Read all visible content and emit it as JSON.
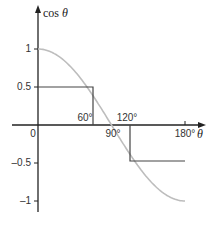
{
  "chart_data": {
    "type": "line",
    "title": "",
    "xlabel": "θ",
    "ylabel": "cos θ",
    "xlim": [
      0,
      180
    ],
    "ylim": [
      -1,
      1
    ],
    "x_ticks": [
      {
        "value": 0,
        "label": "0"
      },
      {
        "value": 60,
        "label": "60°"
      },
      {
        "value": 90,
        "label": "90°"
      },
      {
        "value": 120,
        "label": "120°"
      },
      {
        "value": 180,
        "label": "180°"
      }
    ],
    "y_ticks": [
      {
        "value": 1,
        "label": "1"
      },
      {
        "value": 0.5,
        "label": "0.5"
      },
      {
        "value": -0.5,
        "label": "–0.5"
      },
      {
        "value": -1,
        "label": "–1"
      }
    ],
    "series": [
      {
        "name": "cos θ",
        "color": "#bdbdbd",
        "x": [
          0,
          15,
          30,
          45,
          60,
          75,
          90,
          105,
          120,
          135,
          150,
          165,
          180
        ],
        "values": [
          1,
          0.966,
          0.866,
          0.707,
          0.5,
          0.259,
          0,
          -0.259,
          -0.5,
          -0.707,
          -0.866,
          -0.966,
          -1
        ]
      }
    ],
    "annotations": [
      {
        "type": "guide",
        "x": 60,
        "y": 0.5,
        "desc": "horizontal from y-axis at 0.5 to curve, vertical down to x-axis at 60°"
      },
      {
        "type": "guide",
        "x": 120,
        "y": -0.5,
        "desc": "vertical from x-axis at 120° down to curve, horizontal to 180° at -0.5"
      }
    ],
    "grid": false,
    "legend": "none"
  },
  "axis": {
    "y_title_prefix": "cos ",
    "y_title_var": "θ",
    "x_title": "θ"
  }
}
